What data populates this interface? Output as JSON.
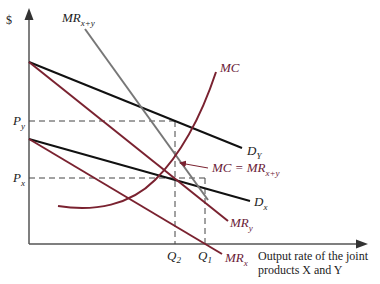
{
  "diagram": {
    "type": "economics-joint-products",
    "y_axis_label": "$",
    "x_axis_label_line1": "Output rate of the joint",
    "x_axis_label_line2": "products X and Y",
    "price_labels": {
      "py": "P",
      "py_sub": "y",
      "px": "P",
      "px_sub": "x"
    },
    "quantity_labels": {
      "q2": "Q",
      "q2_sub": "2",
      "q1": "Q",
      "q1_sub": "1"
    },
    "curves": {
      "dy": {
        "label": "D",
        "sub": "Y",
        "color": "#111111"
      },
      "dx": {
        "label": "D",
        "sub": "x",
        "color": "#111111"
      },
      "mry": {
        "label": "MR",
        "sub": "y",
        "color": "#7a2230"
      },
      "mrx": {
        "label": "MR",
        "sub": "x",
        "color": "#7a2230"
      },
      "mrxy": {
        "label": "MR",
        "sub": "x+y",
        "color": "#777777"
      },
      "mc": {
        "label": "MC",
        "color": "#7a2230"
      }
    },
    "annotation": {
      "text": "MC = MR",
      "sub": "x+y"
    },
    "colors": {
      "axis": "#555555",
      "dashed": "#444444",
      "label_red": "#6b2238"
    }
  }
}
